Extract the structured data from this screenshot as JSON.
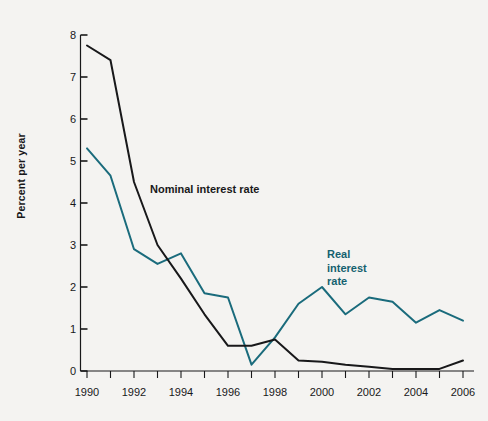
{
  "chart_data": {
    "type": "line",
    "title": "",
    "xlabel": "",
    "ylabel": "Percent per year",
    "xlim": [
      1990,
      2006
    ],
    "ylim": [
      0,
      8
    ],
    "yticks": [
      0,
      1,
      2,
      3,
      4,
      5,
      6,
      7,
      8
    ],
    "xticks": [
      1990,
      1992,
      1994,
      1996,
      1998,
      2000,
      2002,
      2004,
      2006
    ],
    "xtick_labels": [
      "1990",
      "1992",
      "1994",
      "1996",
      "1998",
      "2000",
      "2002",
      "2004",
      "2006"
    ],
    "ytick_labels": [
      "0",
      "1",
      "2",
      "3",
      "4",
      "5",
      "6",
      "7",
      "8"
    ],
    "minor_xticks_every": 1,
    "grid": false,
    "legend_position": "inline-annotations",
    "x": [
      1990,
      1991,
      1992,
      1993,
      1994,
      1995,
      1996,
      1997,
      1998,
      1999,
      2000,
      2001,
      2002,
      2003,
      2004,
      2005,
      2006
    ],
    "series": [
      {
        "name": "Nominal interest rate",
        "color": "#18181a",
        "values": [
          7.75,
          7.4,
          4.5,
          3.0,
          2.2,
          1.35,
          0.6,
          0.6,
          0.75,
          0.25,
          0.22,
          0.15,
          0.1,
          0.05,
          0.05,
          0.05,
          0.25
        ]
      },
      {
        "name": "Real interest rate",
        "color": "#1a6b7c",
        "values": [
          5.3,
          4.65,
          2.9,
          2.55,
          2.8,
          1.85,
          1.75,
          0.15,
          0.8,
          1.6,
          2.0,
          1.35,
          1.75,
          1.65,
          1.15,
          1.45,
          1.2
        ]
      }
    ],
    "annotations": [
      {
        "name": "nominal-interest-rate-label",
        "text": "Nominal interest rate",
        "color": "#18181a"
      },
      {
        "name": "real-interest-rate-label",
        "text": "Real\ninterest\nrate",
        "lines": [
          "Real",
          "interest",
          "rate"
        ],
        "color": "#1a6b7c"
      }
    ]
  },
  "axes": {
    "y_axis_title": "Percent per year"
  },
  "colors": {
    "background": "#f4f3f1",
    "axis": "#18181a",
    "nominal": "#18181a",
    "real": "#1a6b7c"
  },
  "labels": {
    "real_line1": "Real",
    "real_line2": "interest",
    "real_line3": "rate",
    "nominal": "Nominal interest rate"
  }
}
